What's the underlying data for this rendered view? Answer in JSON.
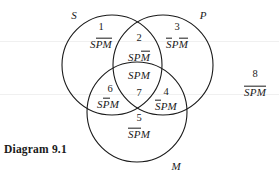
{
  "caption": "Diagram 9.1",
  "circles": [
    {
      "name": "S",
      "label": "S",
      "cx": 112,
      "cy": 65,
      "r": 50,
      "label_x": 74,
      "label_y": 15
    },
    {
      "name": "P",
      "label": "P",
      "cx": 163,
      "cy": 65,
      "r": 50,
      "label_x": 203,
      "label_y": 15
    },
    {
      "name": "M",
      "label": "M",
      "cx": 137,
      "cy": 112,
      "r": 50,
      "label_x": 176,
      "label_y": 166
    }
  ],
  "regions": [
    {
      "number": "1",
      "expr": "SP̄M̄",
      "parts": [
        {
          "text": "S",
          "bar": false
        },
        {
          "text": "PM",
          "bar": true
        }
      ],
      "num_x": 101,
      "num_y": 27,
      "expr_x": 101,
      "expr_y": 44
    },
    {
      "number": "2",
      "expr": "SPM̄",
      "parts": [
        {
          "text": "SP",
          "bar": false
        },
        {
          "text": "M",
          "bar": true
        }
      ],
      "num_x": 139,
      "num_y": 38,
      "expr_x": 139,
      "expr_y": 57
    },
    {
      "number": "3",
      "expr": "S̄PM̄",
      "parts": [
        {
          "text": "S",
          "bar": true
        },
        {
          "text": "P",
          "bar": false
        },
        {
          "text": "M",
          "bar": true
        }
      ],
      "num_x": 177,
      "num_y": 27,
      "expr_x": 177,
      "expr_y": 44
    },
    {
      "number": "4",
      "expr": "S̄PM",
      "parts": [
        {
          "text": "S",
          "bar": true
        },
        {
          "text": "PM",
          "bar": false
        }
      ],
      "num_x": 166,
      "num_y": 92,
      "expr_x": 166,
      "expr_y": 106
    },
    {
      "number": "5",
      "expr": "S̄P̄M",
      "parts": [
        {
          "text": "SP",
          "bar": true
        },
        {
          "text": "M",
          "bar": false
        }
      ],
      "num_x": 139,
      "num_y": 118,
      "expr_x": 139,
      "expr_y": 134
    },
    {
      "number": "6",
      "expr": "SP̄M",
      "parts": [
        {
          "text": "S",
          "bar": false
        },
        {
          "text": "P",
          "bar": true
        },
        {
          "text": "M",
          "bar": false
        }
      ],
      "num_x": 110,
      "num_y": 89,
      "expr_x": 108,
      "expr_y": 104
    },
    {
      "number": "7",
      "expr": "SPM",
      "parts": [
        {
          "text": "SPM",
          "bar": false
        }
      ],
      "num_x": 139,
      "num_y": 93,
      "expr_x": 139,
      "expr_y": 76
    },
    {
      "number": "8",
      "expr": "S̄P̄M̄",
      "parts": [
        {
          "text": "SPM",
          "bar": true
        }
      ],
      "num_x": 255,
      "num_y": 74,
      "expr_x": 255,
      "expr_y": 92
    }
  ],
  "stroke_color": "#1a1a1a",
  "background_color": "#ffffff"
}
